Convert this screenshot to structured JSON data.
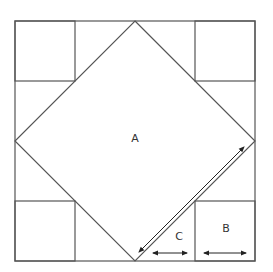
{
  "diagram": {
    "type": "quilt-block",
    "labels": {
      "a": "A",
      "b": "B",
      "c": "C"
    },
    "colors": {
      "line": "#555555",
      "arrow": "#222222",
      "text": "#333333",
      "background": "#ffffff"
    },
    "pieces": [
      {
        "id": "A",
        "shape": "square-on-point",
        "description": "center diamond"
      },
      {
        "id": "B",
        "shape": "corner-square",
        "count": 4
      },
      {
        "id": "C",
        "shape": "triangle",
        "count": 8
      }
    ],
    "dimension_arrows": [
      {
        "label": "A",
        "orientation": "diagonal"
      },
      {
        "label": "C",
        "orientation": "horizontal"
      },
      {
        "label": "B",
        "orientation": "horizontal"
      }
    ]
  }
}
